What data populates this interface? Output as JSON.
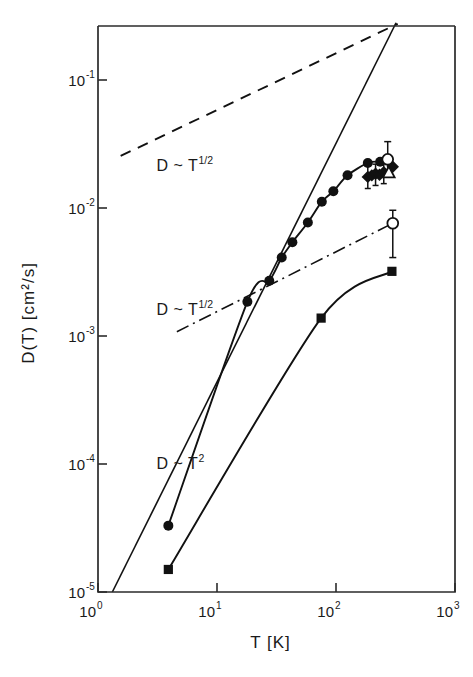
{
  "chart_data": {
    "type": "scatter",
    "title": "",
    "xlabel": "T [K]",
    "ylabel": "D(T)  [cm²/s]",
    "xscale": "log",
    "yscale": "log",
    "xlim": [
      1,
      1000
    ],
    "ylim": [
      1e-05,
      0.3
    ],
    "grid": false,
    "legend_position": "none",
    "xticks": [
      {
        "value": 1,
        "mantissa": "10",
        "exponent": "0"
      },
      {
        "value": 10,
        "mantissa": "10",
        "exponent": "1"
      },
      {
        "value": 100,
        "mantissa": "10",
        "exponent": "2"
      },
      {
        "value": 1000,
        "mantissa": "10",
        "exponent": "3"
      }
    ],
    "yticks": [
      {
        "value": 0.1,
        "mantissa": "10",
        "exponent": "-1"
      },
      {
        "value": 0.01,
        "mantissa": "10",
        "exponent": "-2"
      },
      {
        "value": 0.001,
        "mantissa": "10",
        "exponent": "-3"
      },
      {
        "value": 0.0001,
        "mantissa": "10",
        "exponent": "-4"
      },
      {
        "value": 1e-05,
        "mantissa": "10",
        "exponent": "-5"
      }
    ],
    "annotations": [
      {
        "id": "upper-sqrt",
        "base": "D ~ T",
        "exponent": "1/2",
        "x_data": 3.1,
        "y_data": 0.0195
      },
      {
        "id": "middle-sqrt",
        "base": "D ~ T",
        "exponent": "1/2",
        "x_data": 3.1,
        "y_data": 0.00145
      },
      {
        "id": "lower-square",
        "base": "D ~ T",
        "exponent": "2",
        "x_data": 3.1,
        "y_data": 9.2e-05
      }
    ],
    "series": [
      {
        "name": "reference-line-upper-sqrt",
        "style": "dashed",
        "marker": "none",
        "label": "D ~ T^1/2",
        "points": [
          [
            1.55,
            0.0255
          ],
          [
            330,
            0.275
          ]
        ]
      },
      {
        "name": "reference-line-middle-sqrt",
        "style": "dashdot",
        "marker": "none",
        "label": "D ~ T^1/2",
        "points": [
          [
            4.6,
            0.00108
          ],
          [
            300,
            0.0076
          ]
        ]
      },
      {
        "name": "reference-line-T-squared",
        "style": "solid",
        "marker": "none",
        "label": "D ~ T^2",
        "points": [
          [
            1.32,
            1e-05
          ],
          [
            320,
            0.28
          ]
        ]
      },
      {
        "name": "filled-circles",
        "style": "solid",
        "marker": "filled-circle",
        "points": [
          [
            3.9,
            3.3e-05
          ],
          [
            18.0,
            0.00185
          ],
          [
            27.5,
            0.0027
          ],
          [
            35.0,
            0.0041
          ],
          [
            43.0,
            0.0054
          ],
          [
            58.0,
            0.0077
          ],
          [
            76.0,
            0.0112
          ],
          [
            95.0,
            0.0135
          ],
          [
            125.0,
            0.018
          ],
          [
            185.0,
            0.0225
          ],
          [
            235.0,
            0.023
          ]
        ]
      },
      {
        "name": "filled-squares",
        "style": "solid",
        "marker": "filled-square",
        "points": [
          [
            3.9,
            1.5e-05
          ],
          [
            75.0,
            0.00138
          ],
          [
            295.0,
            0.0032
          ]
        ]
      },
      {
        "name": "filled-diamonds",
        "style": "none",
        "marker": "filled-diamond",
        "points": [
          [
            185.0,
            0.0175
          ],
          [
            200.0,
            0.018
          ],
          [
            215.0,
            0.0185
          ],
          [
            232.0,
            0.0182
          ],
          [
            252.0,
            0.019
          ],
          [
            300.0,
            0.021
          ]
        ]
      },
      {
        "name": "open-circle-upper",
        "style": "none",
        "marker": "open-circle",
        "points": [
          [
            272.0,
            0.024
          ]
        ],
        "yerr": [
          [
            0.0175,
            0.033
          ]
        ]
      },
      {
        "name": "open-circle-lower",
        "style": "none",
        "marker": "open-circle",
        "points": [
          [
            300.0,
            0.0076
          ]
        ],
        "yerr": [
          [
            0.0041,
            0.0096
          ]
        ]
      },
      {
        "name": "open-triangle",
        "style": "none",
        "marker": "open-triangle",
        "points": [
          [
            278.0,
            0.0188
          ]
        ]
      },
      {
        "name": "error-bars-cluster",
        "style": "none",
        "marker": "none",
        "bars": [
          {
            "x": 185.0,
            "ylow": 0.0142,
            "yhigh": 0.0215
          },
          {
            "x": 215.0,
            "ylow": 0.015,
            "yhigh": 0.022
          },
          {
            "x": 252.0,
            "ylow": 0.0155,
            "yhigh": 0.023
          }
        ]
      }
    ]
  }
}
